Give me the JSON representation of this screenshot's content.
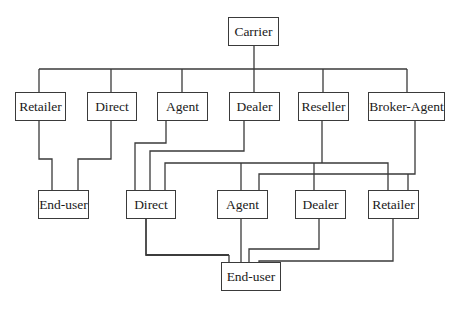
{
  "diagram": {
    "root": {
      "label": "Carrier"
    },
    "channels": [
      {
        "label": "Retailer"
      },
      {
        "label": "Direct"
      },
      {
        "label": "Agent"
      },
      {
        "label": "Dealer"
      },
      {
        "label": "Reseller"
      },
      {
        "label": "Broker-Agent"
      }
    ],
    "left_end": {
      "label": "End-user"
    },
    "second_tier": [
      {
        "label": "Direct"
      },
      {
        "label": "Agent"
      },
      {
        "label": "Dealer"
      },
      {
        "label": "Retailer"
      }
    ],
    "bottom_end": {
      "label": "End-user"
    },
    "edges": [
      [
        "Carrier",
        "Retailer"
      ],
      [
        "Carrier",
        "Direct"
      ],
      [
        "Carrier",
        "Agent"
      ],
      [
        "Carrier",
        "Dealer"
      ],
      [
        "Carrier",
        "Reseller"
      ],
      [
        "Carrier",
        "Broker-Agent"
      ],
      [
        "Retailer",
        "End-user (left)"
      ],
      [
        "Direct",
        "End-user (left)"
      ],
      [
        "Agent",
        "Direct (tier 2)"
      ],
      [
        "Dealer",
        "Direct (tier 2)"
      ],
      [
        "Reseller",
        "Direct (tier 2)"
      ],
      [
        "Reseller",
        "Agent (tier 2)"
      ],
      [
        "Reseller",
        "Dealer (tier 2)"
      ],
      [
        "Reseller",
        "Retailer (tier 2)"
      ],
      [
        "Broker-Agent",
        "Agent (tier 2)"
      ],
      [
        "Broker-Agent",
        "Retailer (tier 2)"
      ],
      [
        "Direct (tier 2)",
        "End-user (bottom)"
      ],
      [
        "Agent (tier 2)",
        "End-user (bottom)"
      ],
      [
        "Dealer (tier 2)",
        "End-user (bottom)"
      ],
      [
        "Retailer (tier 2)",
        "End-user (bottom)"
      ]
    ]
  }
}
